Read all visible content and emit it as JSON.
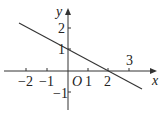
{
  "diagram": {
    "type": "coordinate-plane-line",
    "axes": {
      "x_label": "x",
      "y_label": "y",
      "origin_label": "O",
      "x_ticks": [
        {
          "value": -2,
          "label": "−2"
        },
        {
          "value": -1,
          "label": "−1"
        },
        {
          "value": 1,
          "label": "1"
        },
        {
          "value": 2,
          "label": "2"
        },
        {
          "value": 3,
          "label": "3"
        }
      ],
      "y_ticks": [
        {
          "value": 2,
          "label": "2"
        },
        {
          "value": 1,
          "label": "1"
        },
        {
          "value": -1,
          "label": "−1"
        }
      ]
    },
    "line": {
      "passes_through": [
        [
          0,
          1
        ],
        [
          2,
          0
        ]
      ],
      "slope": -0.5,
      "intercept": 1,
      "color": "#333333"
    }
  }
}
